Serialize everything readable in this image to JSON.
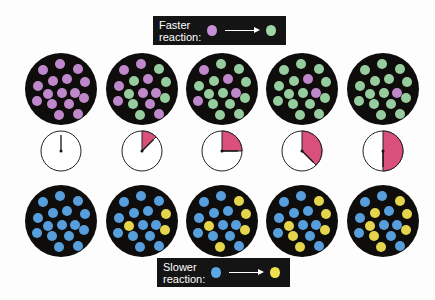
{
  "legend_top": {
    "label_line1": "Faster",
    "label_line2": "reaction:",
    "reactant_color": "#c98fd6",
    "product_color": "#9fd8a6"
  },
  "legend_bottom": {
    "label_line1": "Slower",
    "label_line2": "reaction:",
    "reactant_color": "#5ba8e8",
    "product_color": "#f0e050"
  },
  "colors": {
    "container": "#0f0d0c",
    "purple": "#c98fd6",
    "green": "#9fd8a6",
    "blue": "#5ba8e8",
    "yellow": "#f0e050",
    "clock_fill": "#d9507a"
  },
  "clock_fractions": [
    0,
    0.125,
    0.25,
    0.375,
    0.5
  ],
  "fast_row": [
    {
      "purple": 16,
      "green": 0
    },
    {
      "purple": 9,
      "green": 7
    },
    {
      "purple": 4,
      "green": 12
    },
    {
      "purple": 2,
      "green": 14
    },
    {
      "purple": 1,
      "green": 15
    }
  ],
  "slow_row": [
    {
      "blue": 16,
      "yellow": 0
    },
    {
      "blue": 13,
      "yellow": 3
    },
    {
      "blue": 11,
      "yellow": 5
    },
    {
      "blue": 10,
      "yellow": 6
    },
    {
      "blue": 9,
      "yellow": 7
    }
  ]
}
